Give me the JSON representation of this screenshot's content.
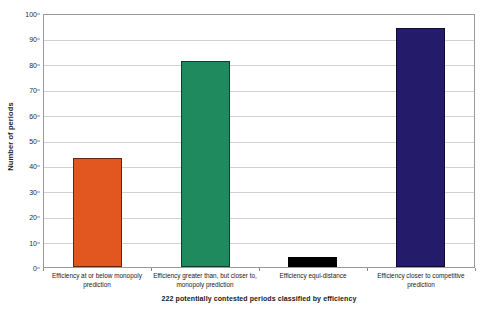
{
  "chart_data": {
    "type": "bar",
    "title": "",
    "xlabel": "222 potentially contested periods classified by efficiency",
    "ylabel": "Number of periods",
    "categories": [
      "Efficiency at or below monopoly prediction",
      "Efficiency greater than, but closer to, monopoly prediction",
      "Efficiency equi-distance",
      "Efficiency closer to competitive prediction"
    ],
    "values": [
      43,
      81,
      4,
      94
    ],
    "bar_colors": [
      "#E2561F",
      "#1E8A5E",
      "#000000",
      "#241C6B"
    ],
    "ylim": [
      0,
      100
    ],
    "ytick_step": 10,
    "ytick_labels": [
      "0",
      "10",
      "20",
      "30",
      "40",
      "50",
      "60",
      "70",
      "80",
      "90",
      "100"
    ],
    "grid": true,
    "grid_axis": "y",
    "legend": false,
    "legend_position": "none",
    "gridline_color": "#d2d2d2",
    "axis_color": "#9a9a9a",
    "background_color": "#ffffff"
  }
}
